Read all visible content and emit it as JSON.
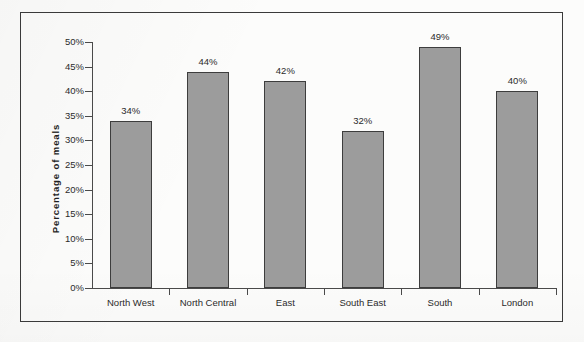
{
  "chart_data": {
    "type": "bar",
    "title": "",
    "subtitle": "",
    "xlabel": "",
    "ylabel": "Percentage  of  meals",
    "categories": [
      "North West",
      "North Central",
      "East",
      "South East",
      "South",
      "London"
    ],
    "values": [
      34,
      44,
      42,
      32,
      49,
      40
    ],
    "value_labels": [
      "34%",
      "44%",
      "42%",
      "32%",
      "49%",
      "40%"
    ],
    "ylim": [
      0,
      50
    ],
    "ytick_step": 5,
    "ytick_labels": [
      "0%",
      "5%",
      "10%",
      "15%",
      "20%",
      "25%",
      "30%",
      "35%",
      "40%",
      "45%",
      "50%"
    ],
    "ytick_values": [
      0,
      5,
      10,
      15,
      20,
      25,
      30,
      35,
      40,
      45,
      50
    ],
    "grid": false,
    "legend": false,
    "legend_position": "none",
    "series": [
      {
        "name": "Percentage of meals",
        "values": [
          34,
          44,
          42,
          32,
          49,
          40
        ]
      }
    ],
    "colors": {
      "bar_fill": "#9c9c9c",
      "bar_border": "#3d3d3d",
      "axis": "#4a4a4a",
      "frame": "#3a3a3a",
      "text": "#2b2b2b",
      "background": "#fcfcfb"
    }
  }
}
